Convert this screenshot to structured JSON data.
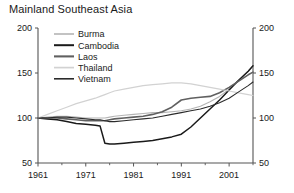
{
  "chart_data": {
    "type": "line",
    "title": "Mainland Southeast Asia",
    "xlabel": "",
    "ylabel": "",
    "xlim": [
      1961,
      2006
    ],
    "ylim": [
      50,
      200
    ],
    "yticks": [
      50,
      100,
      150,
      200
    ],
    "ytick_labels": [
      "50",
      "100",
      "150",
      "200"
    ],
    "xticks": [
      1961,
      1971,
      1981,
      1991,
      2001
    ],
    "xtick_labels": [
      "1961",
      "1971",
      "1981",
      "1991",
      "2001"
    ],
    "xticks_minor": [
      1966,
      1976,
      1986,
      1996,
      2006
    ],
    "grid": false,
    "legend_position": "top-left",
    "right_axis_mirrored": true,
    "x": [
      1961,
      1963,
      1965,
      1967,
      1969,
      1971,
      1973,
      1974,
      1975,
      1976,
      1977,
      1979,
      1981,
      1983,
      1985,
      1987,
      1989,
      1991,
      1993,
      1995,
      1997,
      1999,
      2001,
      2003,
      2005,
      2006
    ],
    "series": [
      {
        "name": "Burma",
        "color": "#b4b4b4",
        "width": 1.1,
        "values": [
          100,
          101,
          102,
          102,
          101,
          100,
          100,
          100,
          100,
          101,
          102,
          103,
          104,
          105,
          106,
          106,
          107,
          108,
          110,
          113,
          118,
          124,
          132,
          142,
          152,
          158
        ]
      },
      {
        "name": "Cambodia",
        "color": "#1a1a1a",
        "width": 1.5,
        "values": [
          100,
          99,
          98,
          96,
          94,
          93,
          92,
          91,
          72,
          71,
          71,
          72,
          73,
          74,
          75,
          77,
          79,
          82,
          90,
          100,
          110,
          120,
          131,
          142,
          152,
          158
        ]
      },
      {
        "name": "Laos",
        "color": "#606060",
        "width": 1.6,
        "values": [
          100,
          100,
          100,
          99,
          98,
          97,
          97,
          97,
          97,
          98,
          99,
          100,
          101,
          102,
          104,
          107,
          112,
          120,
          122,
          123,
          124,
          128,
          134,
          141,
          148,
          151
        ]
      },
      {
        "name": "Thailand",
        "color": "#d2d2d2",
        "width": 1.2,
        "values": [
          100,
          104,
          108,
          112,
          116,
          119,
          122,
          124,
          126,
          128,
          130,
          132,
          134,
          136,
          137,
          138,
          139,
          139,
          138,
          136,
          134,
          132,
          130,
          128,
          126,
          125
        ]
      },
      {
        "name": "Vietnam",
        "color": "#2b2b2b",
        "width": 1.1,
        "values": [
          100,
          100,
          101,
          101,
          100,
          99,
          98,
          98,
          97,
          96,
          96,
          97,
          98,
          99,
          100,
          102,
          104,
          106,
          108,
          110,
          113,
          117,
          122,
          129,
          136,
          140
        ]
      }
    ]
  },
  "plot_geometry": {
    "left": 38,
    "right": 253,
    "top": 28,
    "bottom": 163
  }
}
